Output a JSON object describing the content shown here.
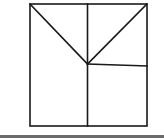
{
  "diagram": {
    "title": "",
    "stroke_color": "#1a1a1a",
    "stroke_width": 1.6,
    "background": "#ffffff",
    "outer_square": {
      "x": 30,
      "y": 4,
      "width": 117,
      "height": 122
    },
    "vertices": {
      "top_left": [
        30,
        4
      ],
      "top_mid": [
        87.5,
        4
      ],
      "top_right": [
        147,
        4
      ],
      "center": [
        87.5,
        64
      ],
      "right_mid": [
        147,
        66
      ],
      "bottom_mid": [
        87.5,
        126
      ],
      "bottom_left": [
        30,
        126
      ],
      "bottom_right": [
        147,
        126
      ]
    },
    "segments": [
      {
        "name": "vertical-divider",
        "from": "top_mid",
        "to": "bottom_mid"
      },
      {
        "name": "diagonal-left",
        "from": "top_left",
        "to": "center"
      },
      {
        "name": "diagonal-right",
        "from": "top_right",
        "to": "center"
      },
      {
        "name": "horizontal-divider",
        "from": "center",
        "to": "right_mid"
      }
    ]
  },
  "bottom_bar": {
    "color": "#6b6b6b"
  }
}
